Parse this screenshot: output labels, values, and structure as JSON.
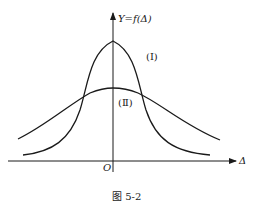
{
  "figure": {
    "caption": "图 5-2",
    "y_axis_label": "Y=f(Δ)",
    "x_axis_label": "Δ",
    "origin_label": "O",
    "curves": [
      {
        "id": "I",
        "label": "(Ⅰ)",
        "description": "tall narrow bell curve",
        "peak_y_px": 41
      },
      {
        "id": "II",
        "label": "(Ⅱ)",
        "description": "low wide bell curve",
        "peak_y_px": 88
      }
    ],
    "colors": {
      "line": "#1a1a1a",
      "background": "#ffffff"
    }
  }
}
